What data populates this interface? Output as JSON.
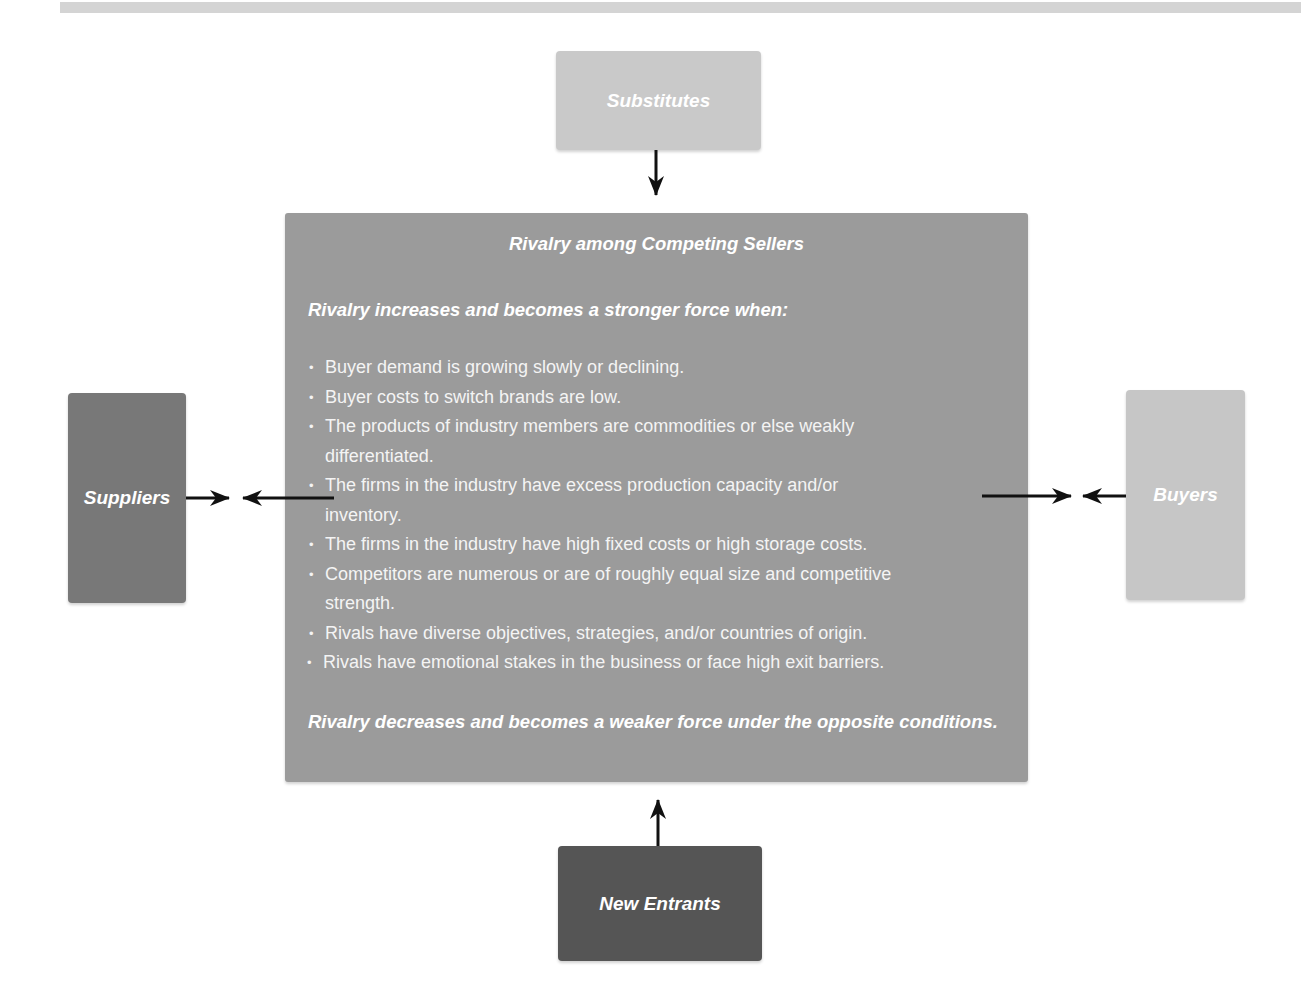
{
  "diagram": {
    "title": "Rivalry among Competing Sellers",
    "forces": {
      "top": {
        "label": "Substitutes",
        "color": "#c9c9c9"
      },
      "left": {
        "label": "Suppliers",
        "color": "#787878"
      },
      "right": {
        "label": "Buyers",
        "color": "#c6c6c6"
      },
      "bottom": {
        "label": "New Entrants",
        "color": "#555555"
      }
    },
    "center": {
      "heading": "Rivalry among Competing Sellers",
      "intro": "Rivalry increases and becomes a stronger force when:",
      "conditions": [
        "Buyer demand is growing slowly or declining.",
        "Buyer costs to switch brands are low.",
        "The products of industry members are commodities or else weakly differentiated.",
        "The firms in the industry have excess production capacity and/or inventory.",
        "The firms in the industry have high fixed costs or high storage costs.",
        "Competitors are numerous or are of roughly equal size and competitive strength.",
        "Rivals have diverse objectives, strategies, and/or countries of origin.",
        "Rivals have emotional stakes in the business or face high exit barriers."
      ],
      "outro": "Rivalry decreases and becomes a weaker force under the opposite conditions.",
      "color": "#9b9b9b"
    },
    "arrows": [
      {
        "from": "Substitutes",
        "to": "center",
        "direction": "down"
      },
      {
        "from": "New Entrants",
        "to": "center",
        "direction": "up"
      },
      {
        "from": "Suppliers",
        "to": "center",
        "direction": "converging"
      },
      {
        "from": "Buyers",
        "to": "center",
        "direction": "converging"
      }
    ]
  }
}
